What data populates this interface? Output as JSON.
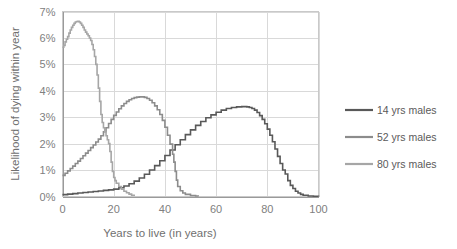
{
  "chart_data": {
    "type": "line",
    "title": "",
    "xlabel": "Years to live (in years)",
    "ylabel": "Likelihood of dying within year",
    "xlim": [
      0,
      100
    ],
    "ylim": [
      0,
      7
    ],
    "xticks": [
      "0",
      "20",
      "40",
      "60",
      "80",
      "100"
    ],
    "xtick_values": [
      0,
      20,
      40,
      60,
      80,
      100
    ],
    "yticks": [
      "0%",
      "1%",
      "2%",
      "3%",
      "4%",
      "5%",
      "6%",
      "7%"
    ],
    "ytick_values": [
      0,
      1,
      2,
      3,
      4,
      5,
      6,
      7
    ],
    "grid": true,
    "legend_position": "right",
    "y_unit": "%",
    "series": [
      {
        "name": "14 yrs males",
        "color": "#595959",
        "x": [
          0,
          2,
          4,
          6,
          8,
          10,
          12,
          14,
          16,
          18,
          20,
          22,
          24,
          26,
          28,
          30,
          32,
          34,
          36,
          38,
          40,
          42,
          44,
          46,
          48,
          50,
          52,
          54,
          56,
          58,
          60,
          62,
          64,
          66,
          68,
          70,
          71,
          72,
          73,
          74,
          75,
          76,
          77,
          78,
          79,
          80,
          81,
          82,
          83,
          84,
          85,
          86,
          87,
          88,
          89,
          90,
          91,
          92,
          93,
          94,
          96,
          98,
          100
        ],
        "values": [
          0.07,
          0.09,
          0.11,
          0.13,
          0.15,
          0.17,
          0.19,
          0.21,
          0.23,
          0.25,
          0.28,
          0.33,
          0.4,
          0.48,
          0.58,
          0.7,
          0.84,
          1.0,
          1.17,
          1.35,
          1.55,
          1.76,
          1.96,
          2.15,
          2.34,
          2.52,
          2.69,
          2.84,
          2.98,
          3.09,
          3.19,
          3.27,
          3.33,
          3.37,
          3.39,
          3.4,
          3.4,
          3.39,
          3.37,
          3.33,
          3.27,
          3.18,
          3.06,
          2.92,
          2.75,
          2.55,
          2.32,
          2.07,
          1.8,
          1.52,
          1.25,
          1.0,
          0.85,
          0.6,
          0.42,
          0.3,
          0.2,
          0.13,
          0.08,
          0.05,
          0.02,
          0.01,
          0.0
        ]
      },
      {
        "name": "52 yrs males",
        "color": "#8c8c8c",
        "x": [
          0,
          1,
          2,
          3,
          4,
          5,
          6,
          7,
          8,
          9,
          10,
          11,
          12,
          13,
          14,
          15,
          16,
          17,
          18,
          19,
          20,
          21,
          22,
          23,
          24,
          25,
          26,
          27,
          28,
          29,
          30,
          31,
          32,
          33,
          34,
          35,
          36,
          37,
          38,
          39,
          40,
          41,
          42,
          43,
          43.5,
          44,
          44.5,
          45,
          46,
          47,
          48,
          50,
          52,
          53
        ],
        "values": [
          0.8,
          0.88,
          0.97,
          1.06,
          1.15,
          1.25,
          1.34,
          1.44,
          1.54,
          1.64,
          1.74,
          1.85,
          1.95,
          2.06,
          2.17,
          2.3,
          2.45,
          2.6,
          2.76,
          2.92,
          3.07,
          3.2,
          3.32,
          3.43,
          3.52,
          3.6,
          3.66,
          3.71,
          3.74,
          3.76,
          3.77,
          3.77,
          3.75,
          3.71,
          3.64,
          3.55,
          3.43,
          3.28,
          3.1,
          2.88,
          2.62,
          2.32,
          1.98,
          1.6,
          1.3,
          0.95,
          0.62,
          0.38,
          0.22,
          0.13,
          0.08,
          0.04,
          0.02,
          0.0
        ]
      },
      {
        "name": "80 yrs males",
        "color": "#a6a6a6",
        "x": [
          0,
          0.5,
          1,
          1.5,
          2,
          2.5,
          3,
          3.5,
          4,
          4.5,
          5,
          5.5,
          6,
          6.5,
          7,
          7.5,
          8,
          8.5,
          9,
          9.5,
          10,
          10.5,
          11,
          11.5,
          12,
          12.5,
          13,
          13.5,
          14,
          14.5,
          15,
          15.5,
          16,
          16.5,
          17,
          17.5,
          18,
          18.5,
          19,
          19.5,
          20,
          20.5,
          21,
          22,
          23,
          24,
          25,
          26,
          27,
          28
        ],
        "values": [
          5.65,
          5.72,
          5.85,
          5.95,
          6.05,
          6.18,
          6.3,
          6.4,
          6.48,
          6.55,
          6.6,
          6.62,
          6.63,
          6.6,
          6.55,
          6.48,
          6.4,
          6.3,
          6.22,
          6.15,
          6.08,
          6.0,
          5.9,
          5.75,
          5.55,
          5.3,
          5.0,
          4.6,
          4.1,
          3.6,
          3.1,
          2.8,
          2.6,
          2.45,
          2.3,
          2.15,
          2.0,
          1.7,
          1.3,
          0.95,
          0.72,
          0.6,
          0.5,
          0.38,
          0.28,
          0.2,
          0.14,
          0.09,
          0.05,
          0.02
        ]
      }
    ]
  },
  "legend": {
    "items": [
      {
        "label": "14 yrs males",
        "color": "#595959"
      },
      {
        "label": "52 yrs males",
        "color": "#8c8c8c"
      },
      {
        "label": "80 yrs males",
        "color": "#a6a6a6"
      }
    ]
  },
  "colors": {
    "background": "#ffffff",
    "gridline": "#d9d9d9",
    "frame": "#c9c9c9",
    "tick_text": "#808080",
    "axis_title_text": "#707070",
    "legend_text": "#5a5a5a"
  }
}
